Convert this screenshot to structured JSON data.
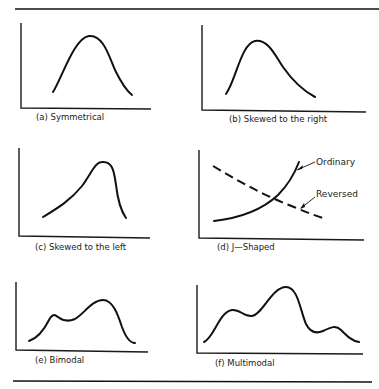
{
  "figure": {
    "panels": [
      {
        "id": "a",
        "caption": "(a) Symmetrical",
        "shape": "symmetrical"
      },
      {
        "id": "b",
        "caption": "(b) Skewed to the right",
        "shape": "right-skewed"
      },
      {
        "id": "c",
        "caption": "(c) Skewed to the left",
        "shape": "left-skewed"
      },
      {
        "id": "d",
        "caption": "(d) J—Shaped",
        "shape": "j-shaped",
        "annotations": {
          "ordinary": "Ordinary",
          "reversed": "Reversed"
        }
      },
      {
        "id": "e",
        "caption": "(e) Bimodal",
        "shape": "bimodal"
      },
      {
        "id": "f",
        "caption": "(f) Multimodal",
        "shape": "multimodal"
      }
    ]
  }
}
